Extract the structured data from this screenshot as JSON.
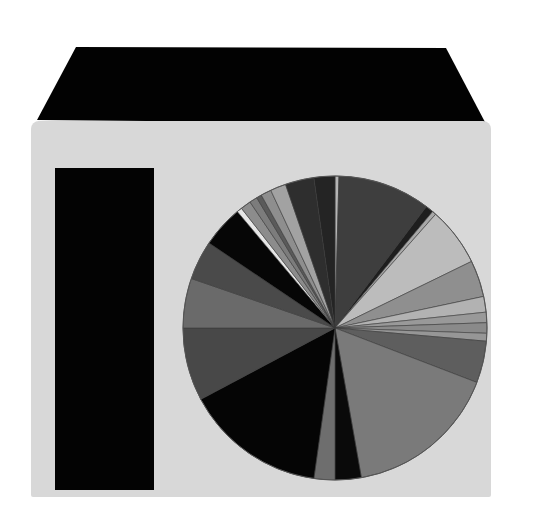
{
  "scene": {
    "background": "#ffffff",
    "box_face_color": "#d8d8d8",
    "box_top_color": "#020202",
    "left_bar_color": "#030303"
  },
  "chart_data": {
    "type": "pie",
    "title": "",
    "legend": [],
    "labels_visible": false,
    "center": [
      335,
      328
    ],
    "radius": 152,
    "start_angle_deg": 0,
    "direction": "clockwise",
    "slices": [
      {
        "start": 0,
        "end": 1.5,
        "color": "#b5b5b5"
      },
      {
        "start": 1.5,
        "end": 37,
        "color": "#3e3e3e"
      },
      {
        "start": 37,
        "end": 40,
        "color": "#1e1e1e"
      },
      {
        "start": 40,
        "end": 41.5,
        "color": "#a8a8a8"
      },
      {
        "start": 41.5,
        "end": 64,
        "color": "#bcbcbc"
      },
      {
        "start": 64,
        "end": 78,
        "color": "#8f8f8f"
      },
      {
        "start": 78,
        "end": 84,
        "color": "#b2b2b2"
      },
      {
        "start": 84,
        "end": 88,
        "color": "#999999"
      },
      {
        "start": 88,
        "end": 92,
        "color": "#8a8a8a"
      },
      {
        "start": 92,
        "end": 95,
        "color": "#969696"
      },
      {
        "start": 95,
        "end": 111,
        "color": "#5e5e5e"
      },
      {
        "start": 111,
        "end": 170,
        "color": "#7a7a7a"
      },
      {
        "start": 170,
        "end": 180,
        "color": "#0a0a0a"
      },
      {
        "start": 180,
        "end": 188,
        "color": "#6e6e6e"
      },
      {
        "start": 188,
        "end": 242,
        "color": "#050505"
      },
      {
        "start": 242,
        "end": 270,
        "color": "#484848"
      },
      {
        "start": 270,
        "end": 289,
        "color": "#6a6a6a"
      },
      {
        "start": 289,
        "end": 304,
        "color": "#4a4a4a"
      },
      {
        "start": 304,
        "end": 320,
        "color": "#060606"
      },
      {
        "start": 320,
        "end": 322,
        "color": "#e6e6e6"
      },
      {
        "start": 322,
        "end": 326,
        "color": "#8c8c8c"
      },
      {
        "start": 326,
        "end": 329,
        "color": "#7c7c7c"
      },
      {
        "start": 329,
        "end": 331,
        "color": "#5a5a5a"
      },
      {
        "start": 331,
        "end": 335,
        "color": "#8e8e8e"
      },
      {
        "start": 335,
        "end": 341,
        "color": "#a2a2a2"
      },
      {
        "start": 341,
        "end": 352,
        "color": "#2e2e2e"
      },
      {
        "start": 352,
        "end": 360,
        "color": "#242424"
      }
    ],
    "values_percent": [
      0.4,
      9.9,
      0.8,
      0.4,
      6.3,
      3.9,
      1.7,
      1.1,
      1.1,
      0.8,
      4.4,
      16.4,
      2.8,
      2.2,
      15.0,
      7.8,
      5.3,
      4.2,
      4.4,
      0.6,
      1.1,
      0.8,
      0.6,
      1.1,
      1.7,
      3.1,
      2.2
    ]
  }
}
